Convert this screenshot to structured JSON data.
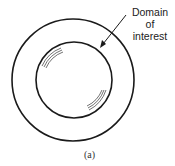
{
  "figure": {
    "annotation": {
      "lines": [
        "Domain",
        "of",
        "interest"
      ]
    },
    "caption": "(a)",
    "colors": {
      "stroke": "#1a1a1a",
      "background": "#ffffff"
    }
  }
}
